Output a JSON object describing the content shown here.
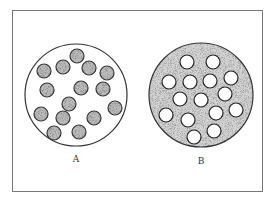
{
  "figure": {
    "frame": {
      "x": 12,
      "y": 10,
      "width": 250,
      "height": 181,
      "stroke": "#777777"
    },
    "panels": [
      {
        "id": "A",
        "label": "A",
        "label_pos": {
          "x": 76,
          "y": 162
        },
        "outer": {
          "cx": 76,
          "cy": 95,
          "r": 51,
          "fill": "#ffffff",
          "stroke": "#333333"
        },
        "inner_fill": "#bdbdbd",
        "inner_stroke": "#333333",
        "inner_r": 7,
        "dots": [
          [
            77,
            56
          ],
          [
            44,
            71
          ],
          [
            63,
            67
          ],
          [
            89,
            68
          ],
          [
            107,
            73
          ],
          [
            47,
            90
          ],
          [
            81,
            88
          ],
          [
            103,
            89
          ],
          [
            69,
            104
          ],
          [
            41,
            114
          ],
          [
            63,
            118
          ],
          [
            94,
            118
          ],
          [
            115,
            108
          ],
          [
            54,
            133
          ],
          [
            79,
            132
          ]
        ]
      },
      {
        "id": "B",
        "label": "B",
        "label_pos": {
          "x": 201,
          "y": 164
        },
        "outer": {
          "cx": 201,
          "cy": 95,
          "r": 52,
          "fill": "#d4d4d4",
          "stroke": "#333333"
        },
        "inner_fill": "#ffffff",
        "inner_stroke": "#222222",
        "inner_r": 7,
        "dots": [
          [
            187,
            62
          ],
          [
            213,
            62
          ],
          [
            169,
            82
          ],
          [
            190,
            82
          ],
          [
            210,
            81
          ],
          [
            231,
            78
          ],
          [
            180,
            99
          ],
          [
            201,
            100
          ],
          [
            225,
            94
          ],
          [
            166,
            115
          ],
          [
            188,
            120
          ],
          [
            216,
            113
          ],
          [
            236,
            110
          ],
          [
            194,
            137
          ],
          [
            214,
            131
          ]
        ]
      }
    ]
  }
}
